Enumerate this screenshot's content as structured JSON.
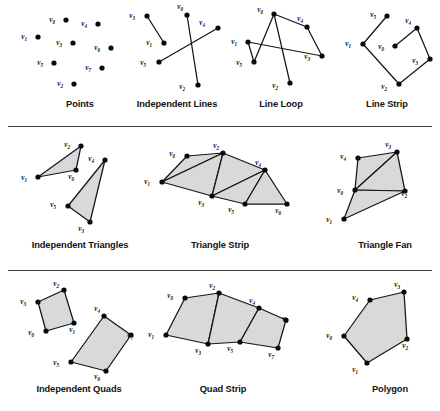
{
  "figure": {
    "colors": {
      "background": "#ffffff",
      "vertex_dot": "#0a0a0a",
      "edge": "#151515",
      "face_fill": "#d9d9d9",
      "divider": "#3b3b3b",
      "caption_text": "#121212"
    },
    "rows": 3,
    "panels_per_row": [
      4,
      3,
      3
    ],
    "dividers": [
      {
        "name": "divider-row1-row2",
        "y": 126
      },
      {
        "name": "divider-row2-row3",
        "y": 270
      }
    ]
  },
  "panels": [
    {
      "id": "points",
      "caption": "Points",
      "caption_x": 30,
      "caption_y": 99,
      "caption_w": 100,
      "type": "points",
      "box": {
        "x": 18,
        "y": 4,
        "w": 115,
        "h": 90
      },
      "vertices": [
        {
          "label": "v",
          "sub": "0",
          "x": 48,
          "y": 16,
          "lx": -11,
          "ly": 2
        },
        {
          "label": "v",
          "sub": "4",
          "x": 80,
          "y": 20,
          "lx": -11,
          "ly": 2
        },
        {
          "label": "v",
          "sub": "1",
          "x": 20,
          "y": 33,
          "lx": -11,
          "ly": 2
        },
        {
          "label": "v",
          "sub": "3",
          "x": 55,
          "y": 39,
          "lx": -11,
          "ly": 2
        },
        {
          "label": "v",
          "sub": "6",
          "x": 93,
          "y": 44,
          "lx": -11,
          "ly": 2
        },
        {
          "label": "v",
          "sub": "5",
          "x": 36,
          "y": 59,
          "lx": -11,
          "ly": 2
        },
        {
          "label": "v",
          "sub": "7",
          "x": 84,
          "y": 64,
          "lx": -11,
          "ly": 2
        },
        {
          "label": "v",
          "sub": "2",
          "x": 56,
          "y": 80,
          "lx": -11,
          "ly": 2
        }
      ],
      "edges": [],
      "faces": []
    },
    {
      "id": "independent-lines",
      "caption": "Independent Lines",
      "caption_x": 122,
      "caption_y": 99,
      "caption_w": 110,
      "type": "lines",
      "box": {
        "x": 126,
        "y": 4,
        "w": 100,
        "h": 90
      },
      "vertices": [
        {
          "label": "v",
          "sub": "3",
          "x": 21,
          "y": 12,
          "lx": -12,
          "ly": 2
        },
        {
          "label": "v",
          "sub": "0",
          "x": 61,
          "y": 11,
          "lx": -4,
          "ly": -6
        },
        {
          "label": "v",
          "sub": "4",
          "x": 92,
          "y": 24,
          "lx": -13,
          "ly": -3
        },
        {
          "label": "v",
          "sub": "1",
          "x": 38,
          "y": 39,
          "lx": -12,
          "ly": 2
        },
        {
          "label": "v",
          "sub": "5",
          "x": 33,
          "y": 58,
          "lx": -13,
          "ly": 3
        },
        {
          "label": "v",
          "sub": "2",
          "x": 72,
          "y": 81,
          "lx": -13,
          "ly": 4
        }
      ],
      "edges": [
        [
          0,
          3
        ],
        [
          1,
          5
        ],
        [
          2,
          4
        ]
      ],
      "faces": []
    },
    {
      "id": "line-loop",
      "caption": "Line Loop",
      "caption_x": 236,
      "caption_y": 99,
      "caption_w": 90,
      "type": "line-loop",
      "box": {
        "x": 232,
        "y": 4,
        "w": 95,
        "h": 90
      },
      "vertices": [
        {
          "label": "v",
          "sub": "0",
          "x": 42,
          "y": 10,
          "lx": -11,
          "ly": -2
        },
        {
          "label": "v",
          "sub": "4",
          "x": 75,
          "y": 23,
          "lx": -4,
          "ly": -6
        },
        {
          "label": "v",
          "sub": "1",
          "x": 16,
          "y": 38,
          "lx": -11,
          "ly": 2
        },
        {
          "label": "v",
          "sub": "3",
          "x": 90,
          "y": 52,
          "lx": -12,
          "ly": 3
        },
        {
          "label": "v",
          "sub": "5",
          "x": 22,
          "y": 58,
          "lx": -12,
          "ly": 3
        },
        {
          "label": "v",
          "sub": "2",
          "x": 58,
          "y": 79,
          "lx": -12,
          "ly": 5
        }
      ],
      "edges": [
        [
          0,
          1
        ],
        [
          1,
          3
        ],
        [
          3,
          2
        ],
        [
          2,
          4
        ],
        [
          4,
          0
        ],
        [
          0,
          5
        ]
      ],
      "faces": []
    },
    {
      "id": "line-strip",
      "caption": "Line Strip",
      "caption_x": 342,
      "caption_y": 99,
      "caption_w": 90,
      "type": "line-strip",
      "box": {
        "x": 334,
        "y": 4,
        "w": 100,
        "h": 90
      },
      "vertices": [
        {
          "label": "v",
          "sub": "5",
          "x": 53,
          "y": 12,
          "lx": -11,
          "ly": 1
        },
        {
          "label": "v",
          "sub": "4",
          "x": 83,
          "y": 24,
          "lx": -6,
          "ly": -5
        },
        {
          "label": "v",
          "sub": "1",
          "x": 29,
          "y": 40,
          "lx": -12,
          "ly": 2
        },
        {
          "label": "v",
          "sub": "0",
          "x": 61,
          "y": 42,
          "lx": -11,
          "ly": 3
        },
        {
          "label": "v",
          "sub": "3",
          "x": 96,
          "y": 55,
          "lx": -12,
          "ly": 4
        },
        {
          "label": "v",
          "sub": "2",
          "x": 65,
          "y": 80,
          "lx": -12,
          "ly": 5
        }
      ],
      "edges": [
        [
          0,
          2
        ],
        [
          2,
          5
        ],
        [
          5,
          4
        ],
        [
          4,
          1
        ],
        [
          1,
          3
        ]
      ],
      "faces": []
    },
    {
      "id": "independent-triangles",
      "caption": "Independent Triangles",
      "caption_x": 10,
      "caption_y": 112,
      "caption_w": 140,
      "type": "triangles",
      "box": {
        "x": 22,
        "y": 6,
        "w": 110,
        "h": 95
      },
      "vertices": [
        {
          "label": "v",
          "sub": "2",
          "x": 59,
          "y": 12,
          "lx": -11,
          "ly": 1
        },
        {
          "label": "v",
          "sub": "4",
          "x": 83,
          "y": 26,
          "lx": -11,
          "ly": 1
        },
        {
          "label": "v",
          "sub": "0",
          "x": 54,
          "y": 36,
          "lx": -2,
          "ly": 9
        },
        {
          "label": "v",
          "sub": "1",
          "x": 16,
          "y": 43,
          "lx": -11,
          "ly": 3
        },
        {
          "label": "v",
          "sub": "5",
          "x": 46,
          "y": 72,
          "lx": -12,
          "ly": 1
        },
        {
          "label": "v",
          "sub": "3",
          "x": 68,
          "y": 88,
          "lx": -6,
          "ly": 9
        }
      ],
      "edges": [],
      "faces": [
        [
          0,
          2,
          3
        ],
        [
          1,
          4,
          5
        ]
      ]
    },
    {
      "id": "triangle-strip",
      "caption": "Triangle Strip",
      "caption_x": 160,
      "caption_y": 112,
      "caption_w": 120,
      "type": "triangle-strip",
      "box": {
        "x": 150,
        "y": 6,
        "w": 145,
        "h": 95
      },
      "vertices": [
        {
          "label": "v",
          "sub": "0",
          "x": 37,
          "y": 22,
          "lx": -12,
          "ly": 0
        },
        {
          "label": "v",
          "sub": "2",
          "x": 73,
          "y": 19,
          "lx": -4,
          "ly": -5
        },
        {
          "label": "v",
          "sub": "4",
          "x": 115,
          "y": 36,
          "lx": -4,
          "ly": -5
        },
        {
          "label": "v",
          "sub": "1",
          "x": 12,
          "y": 48,
          "lx": -12,
          "ly": 2
        },
        {
          "label": "v",
          "sub": "3",
          "x": 62,
          "y": 62,
          "lx": -8,
          "ly": 9
        },
        {
          "label": "v",
          "sub": "5",
          "x": 95,
          "y": 70,
          "lx": -11,
          "ly": 8
        },
        {
          "label": "v",
          "sub": "6",
          "x": 137,
          "y": 70,
          "lx": -6,
          "ly": 9
        }
      ],
      "edges": [],
      "faces": [
        [
          0,
          1,
          3
        ],
        [
          1,
          3,
          4
        ],
        [
          1,
          4,
          2
        ],
        [
          4,
          2,
          5
        ],
        [
          2,
          5,
          6
        ]
      ]
    },
    {
      "id": "triangle-fan",
      "caption": "Triangle Fan",
      "caption_x": 330,
      "caption_y": 112,
      "caption_w": 110,
      "type": "triangle-fan",
      "box": {
        "x": 318,
        "y": 6,
        "w": 110,
        "h": 95
      },
      "vertices": [
        {
          "label": "v",
          "sub": "0",
          "x": 37,
          "y": 56,
          "lx": -12,
          "ly": 3
        },
        {
          "label": "v",
          "sub": "3",
          "x": 79,
          "y": 18,
          "lx": -6,
          "ly": -5
        },
        {
          "label": "v",
          "sub": "4",
          "x": 40,
          "y": 24,
          "lx": -12,
          "ly": 1
        },
        {
          "label": "v",
          "sub": "2",
          "x": 87,
          "y": 57,
          "lx": 2,
          "ly": 5
        },
        {
          "label": "v",
          "sub": "1",
          "x": 26,
          "y": 85,
          "lx": -12,
          "ly": 3
        }
      ],
      "edges": [],
      "faces": [
        [
          0,
          2,
          1
        ],
        [
          0,
          1,
          3
        ],
        [
          0,
          3,
          4
        ]
      ]
    },
    {
      "id": "independent-quads",
      "caption": "Independent Quads",
      "caption_x": 14,
      "caption_y": 112,
      "caption_w": 130,
      "type": "quads",
      "box": {
        "x": 22,
        "y": 6,
        "w": 115,
        "h": 95
      },
      "vertices": [
        {
          "label": "v",
          "sub": "2",
          "x": 42,
          "y": 12,
          "lx": -5,
          "ly": -4
        },
        {
          "label": "v",
          "sub": "3",
          "x": 16,
          "y": 24,
          "lx": -12,
          "ly": 2
        },
        {
          "label": "v",
          "sub": "4",
          "x": 82,
          "y": 38,
          "lx": -4,
          "ly": -5
        },
        {
          "label": "v",
          "sub": "1",
          "x": 52,
          "y": 45,
          "lx": 1,
          "ly": 9
        },
        {
          "label": "v",
          "sub": "7",
          "x": 109,
          "y": 57,
          "lx": 2,
          "ly": 3
        },
        {
          "label": "v",
          "sub": "0",
          "x": 24,
          "y": 53,
          "lx": -12,
          "ly": 4
        },
        {
          "label": "v",
          "sub": "5",
          "x": 49,
          "y": 84,
          "lx": -12,
          "ly": 3
        },
        {
          "label": "v",
          "sub": "6",
          "x": 84,
          "y": 93,
          "lx": -6,
          "ly": 8
        }
      ],
      "edges": [],
      "faces": [
        [
          1,
          0,
          3,
          5
        ],
        [
          2,
          4,
          7,
          6
        ]
      ]
    },
    {
      "id": "quad-strip",
      "caption": "Quad Strip",
      "caption_x": 168,
      "caption_y": 112,
      "caption_w": 110,
      "type": "quad-strip",
      "box": {
        "x": 156,
        "y": 6,
        "w": 135,
        "h": 95
      },
      "vertices": [
        {
          "label": "v",
          "sub": "0",
          "x": 29,
          "y": 20,
          "lx": -12,
          "ly": 0
        },
        {
          "label": "v",
          "sub": "2",
          "x": 63,
          "y": 15,
          "lx": -4,
          "ly": -5
        },
        {
          "label": "v",
          "sub": "4",
          "x": 103,
          "y": 30,
          "lx": -4,
          "ly": -5
        },
        {
          "label": "v",
          "sub": "6",
          "x": 130,
          "y": 42,
          "lx": 2,
          "ly": 1
        },
        {
          "label": "v",
          "sub": "1",
          "x": 10,
          "y": 57,
          "lx": -12,
          "ly": 2
        },
        {
          "label": "v",
          "sub": "3",
          "x": 52,
          "y": 66,
          "lx": -7,
          "ly": 9
        },
        {
          "label": "v",
          "sub": "5",
          "x": 84,
          "y": 64,
          "lx": -7,
          "ly": 9
        },
        {
          "label": "v",
          "sub": "7",
          "x": 122,
          "y": 70,
          "lx": -4,
          "ly": 9
        }
      ],
      "edges": [],
      "faces": [
        [
          0,
          1,
          5,
          4
        ],
        [
          1,
          2,
          6,
          5
        ],
        [
          2,
          3,
          7,
          6
        ]
      ]
    },
    {
      "id": "polygon",
      "caption": "Polygon",
      "caption_x": 345,
      "caption_y": 112,
      "caption_w": 90,
      "type": "polygon",
      "box": {
        "x": 328,
        "y": 6,
        "w": 105,
        "h": 95
      },
      "vertices": [
        {
          "label": "v",
          "sub": "3",
          "x": 76,
          "y": 14,
          "lx": -4,
          "ly": -5
        },
        {
          "label": "v",
          "sub": "4",
          "x": 42,
          "y": 22,
          "lx": -12,
          "ly": 0
        },
        {
          "label": "v",
          "sub": "0",
          "x": 16,
          "y": 58,
          "lx": -12,
          "ly": 2
        },
        {
          "label": "v",
          "sub": "2",
          "x": 79,
          "y": 61,
          "lx": 1,
          "ly": 9
        },
        {
          "label": "v",
          "sub": "1",
          "x": 39,
          "y": 85,
          "lx": -9,
          "ly": 9
        }
      ],
      "edges": [],
      "faces": [
        [
          0,
          1,
          2,
          4,
          3
        ]
      ]
    }
  ]
}
